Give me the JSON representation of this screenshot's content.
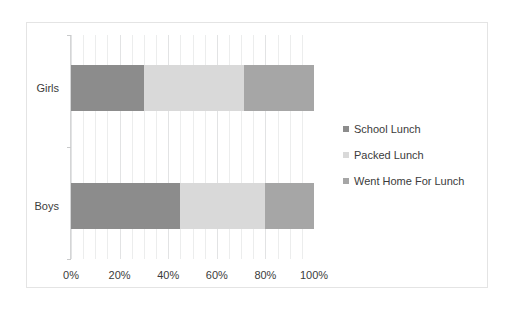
{
  "chart_data": {
    "type": "bar",
    "orientation": "horizontal",
    "stacked": true,
    "normalized": true,
    "title": "",
    "xlabel": "",
    "ylabel": "",
    "categories": [
      "Girls",
      "Boys"
    ],
    "series": [
      {
        "name": "School Lunch",
        "values": [
          30,
          45
        ],
        "color": "#8c8c8c"
      },
      {
        "name": "Packed Lunch",
        "values": [
          41,
          35
        ],
        "color": "#d9d9d9"
      },
      {
        "name": "Went Home For Lunch",
        "values": [
          29,
          20
        ],
        "color": "#a6a6a6"
      }
    ],
    "xlim": [
      0,
      100
    ],
    "xticks": [
      0,
      20,
      40,
      60,
      80,
      100
    ],
    "xtick_labels": [
      "0%",
      "20%",
      "40%",
      "60%",
      "80%",
      "100%"
    ],
    "minor_gridline_step": 5,
    "grid": true,
    "legend_position": "right"
  },
  "legend": {
    "items": [
      {
        "label": "School Lunch"
      },
      {
        "label": "Packed Lunch"
      },
      {
        "label": "Went Home For Lunch"
      }
    ]
  },
  "colors": {
    "school_lunch": "#8c8c8c",
    "packed_lunch": "#d9d9d9",
    "went_home": "#a6a6a6",
    "gridline": "#eceded",
    "axis": "#d4d5d6",
    "text": "#3b3b3b",
    "frame_border": "#e4e4e4",
    "background": "#ffffff"
  }
}
